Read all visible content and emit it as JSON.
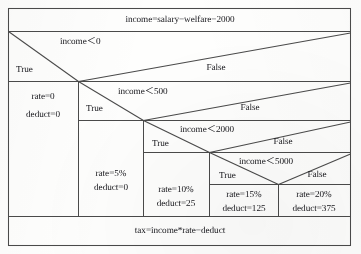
{
  "diagram": {
    "kind": "nassi-shneiderman-structogram",
    "title_row": {
      "text": "income=salary−welfare−2000"
    },
    "footer_row": {
      "text": "tax=income*rate−deduct"
    },
    "ink_color": "#15151a",
    "line_color": "#4a4a4a",
    "paper_color": "#fefefd",
    "decisions": [
      {
        "id": "d1",
        "condition": "income＜0",
        "true_label": "True",
        "false_label": "False"
      },
      {
        "id": "d2",
        "condition": "income＜500",
        "true_label": "True",
        "false_label": "False"
      },
      {
        "id": "d3",
        "condition": "income＜2000",
        "true_label": "True",
        "false_label": "False"
      },
      {
        "id": "d4",
        "condition": "income＜5000",
        "true_label": "True",
        "false_label": "False"
      }
    ],
    "outcomes": [
      {
        "id": "o1",
        "rate": "rate=0",
        "deduct": "deduct=0"
      },
      {
        "id": "o2",
        "rate": "rate=5%",
        "deduct": "deduct=0"
      },
      {
        "id": "o3",
        "rate": "rate=10%",
        "deduct": "deduct=25"
      },
      {
        "id": "o4",
        "rate": "rate=15%",
        "deduct": "deduct=125"
      },
      {
        "id": "o5",
        "rate": "rate=20%",
        "deduct": "deduct=375"
      }
    ]
  }
}
